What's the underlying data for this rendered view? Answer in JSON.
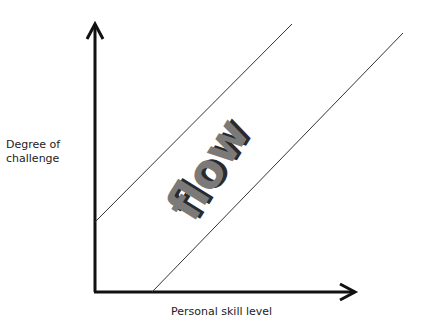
{
  "diagram": {
    "y_axis_label_line1": "Degree of",
    "y_axis_label_line2": "challenge",
    "x_axis_label": "Personal skill level",
    "center_label": "flow",
    "colors": {
      "axis": "#111111",
      "line": "#333333",
      "text_dark": "#3a3a3a",
      "text_light": "#9a9a9a"
    }
  }
}
